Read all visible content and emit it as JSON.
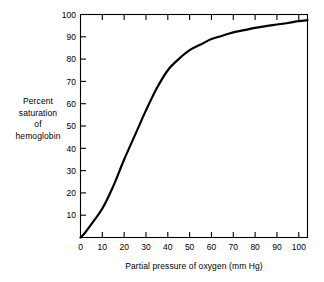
{
  "chart_data": {
    "type": "line",
    "title": "",
    "xlabel": "Partial pressure of oxygen (mm Hg)",
    "ylabel_lines": [
      "Percent",
      "saturation",
      "of",
      "hemoglobin"
    ],
    "ylabel": "Percent saturation of hemoglobin",
    "xlim": [
      0,
      104
    ],
    "ylim": [
      0,
      100
    ],
    "xticks": [
      0,
      10,
      20,
      30,
      40,
      50,
      60,
      70,
      80,
      90,
      100
    ],
    "xtick_labels": [
      "0",
      "10",
      "20",
      "30",
      "40",
      "50",
      "60",
      "70",
      "80",
      "90",
      "100"
    ],
    "yticks": [
      10,
      20,
      30,
      40,
      50,
      60,
      70,
      80,
      90,
      100
    ],
    "ytick_labels": [
      "10",
      "20",
      "30",
      "40",
      "50",
      "60",
      "70",
      "80",
      "90",
      "100"
    ],
    "grid": false,
    "legend": null,
    "frame": "box",
    "tick_direction": "in",
    "line_color": "#000000",
    "line_width_px": 2.2,
    "series": [
      {
        "name": "Oxyhemoglobin dissociation curve",
        "x": [
          0,
          2,
          5,
          10,
          15,
          20,
          25,
          30,
          35,
          40,
          45,
          50,
          55,
          60,
          65,
          70,
          75,
          80,
          85,
          90,
          95,
          100,
          104
        ],
        "values": [
          0,
          2,
          6,
          13,
          23,
          35,
          46,
          57,
          67,
          75,
          80,
          84,
          86.5,
          89,
          90.5,
          92,
          93,
          94,
          94.8,
          95.5,
          96.2,
          97,
          97.4
        ]
      }
    ]
  },
  "figure": {
    "background_color": "#ffffff",
    "axis_color": "#000000"
  }
}
